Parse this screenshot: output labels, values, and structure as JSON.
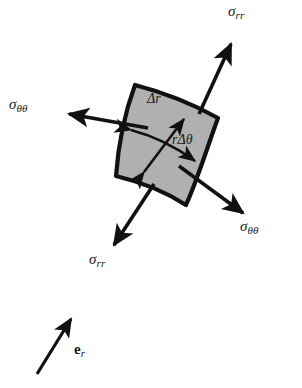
{
  "figure": {
    "type": "stress-element-diagram",
    "background_color": "#ffffff",
    "element_fill_color": "#b0b0b0",
    "stroke_color": "#111111",
    "element": {
      "name": "annular-sector",
      "fill": "#b0b0b0",
      "outline_width": 4,
      "corners": {
        "inner_left": [
          135,
          85
        ],
        "outer_left": [
          116,
          176
        ],
        "outer_right": [
          186,
          205
        ],
        "inner_right": [
          218,
          118
        ]
      }
    },
    "stress_arrows": [
      {
        "id": "sigma-rr-top-right",
        "label": "σ",
        "subscript": "rr",
        "direction": "outward-upper-right",
        "tail": [
          200,
          112
        ],
        "tip": [
          233,
          41
        ],
        "label_pos": [
          229,
          8
        ]
      },
      {
        "id": "sigma-thetatheta-left",
        "label": "σ",
        "subscript": "θθ",
        "direction": "outward-left",
        "tail": [
          146,
          127
        ],
        "tip": [
          66,
          113
        ],
        "label_pos": [
          8,
          101
        ]
      },
      {
        "id": "sigma-thetatheta-bottom-right",
        "label": "σ",
        "subscript": "θθ",
        "direction": "outward-lower-right",
        "tail": [
          180,
          167
        ],
        "tip": [
          246,
          216
        ],
        "label_pos": [
          241,
          225
        ]
      },
      {
        "id": "sigma-rr-bottom-left",
        "label": "σ",
        "subscript": "rr",
        "direction": "outward-lower-left",
        "tail": [
          153,
          185
        ],
        "tip": [
          112,
          248
        ],
        "label_pos": [
          90,
          256
        ]
      }
    ],
    "dimension_arrows": [
      {
        "id": "delta-r",
        "label": "Δr",
        "text_prefix": "Δ",
        "text_italic": "r",
        "double_headed": true,
        "from": [
          142,
          174
        ],
        "to": [
          185,
          117
        ],
        "label_pos": [
          148,
          98
        ]
      },
      {
        "id": "r-delta-theta",
        "label": "rΔθ",
        "text_italic_lead": "r",
        "text_prefix": "Δ",
        "text_italic": "θ",
        "double_headed": true,
        "from": [
          129,
          129
        ],
        "to": [
          197,
          163
        ],
        "label_pos": [
          177,
          139
        ]
      }
    ],
    "basis_vector": {
      "id": "e-r",
      "label": "e",
      "subscript": "r",
      "bold_symbol": true,
      "tail": [
        36,
        375
      ],
      "tip": [
        73,
        316
      ],
      "label_pos": [
        75,
        348
      ]
    }
  }
}
